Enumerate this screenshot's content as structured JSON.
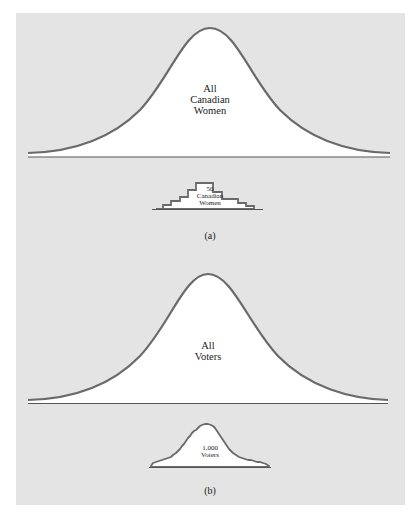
{
  "colors": {
    "background": "#ffffff",
    "panel": "#e4e4e4",
    "curve_stroke": "#6a6a6a",
    "curve_fill": "#ffffff",
    "baseline": "#555555",
    "text": "#222222"
  },
  "figure_a": {
    "population_label_line1": "All",
    "population_label_line2": "Canadian",
    "population_label_line3": "Women",
    "sample_label_line1": "50",
    "sample_label_line2": "Canadian",
    "sample_label_line3": "Women",
    "caption": "(a)"
  },
  "figure_b": {
    "population_label_line1": "All",
    "population_label_line2": "Voters",
    "sample_label_line1": "1,000",
    "sample_label_line2": "Voters",
    "caption": "(b)"
  }
}
